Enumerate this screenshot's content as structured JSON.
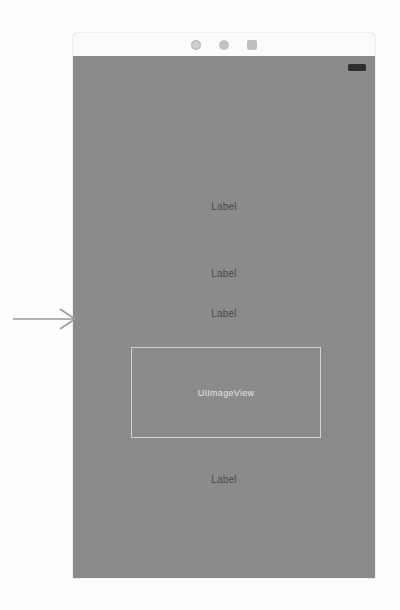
{
  "screenshot": {
    "width": 400,
    "height": 610,
    "background_color": "#fdfdfd"
  },
  "device": {
    "name": "iphone-mockup",
    "body_color": "#8b8b8b",
    "header_color": "#fbfbfb",
    "header": {
      "sensors": [
        {
          "name": "front-camera-icon",
          "shape": "ring"
        },
        {
          "name": "proximity-sensor-icon",
          "shape": "dot"
        },
        {
          "name": "earpiece-speaker-icon",
          "shape": "grille"
        }
      ]
    },
    "status_bar": {
      "battery_icon": "battery-icon",
      "battery_color": "#2e2e2e"
    }
  },
  "screen": {
    "labels": [
      {
        "text": "Label"
      },
      {
        "text": "Label"
      },
      {
        "text": "Label"
      },
      {
        "text": "Label"
      }
    ],
    "label_color": "#4a4a4a",
    "image_view": {
      "text": "UIImageView",
      "border_color": "#d2d2d2",
      "text_color": "#e4e4e4"
    }
  },
  "annotation": {
    "arrow": {
      "name": "pointer-arrow",
      "direction": "right",
      "color": "#9a9a9a",
      "points_to": "UIImageView"
    }
  }
}
